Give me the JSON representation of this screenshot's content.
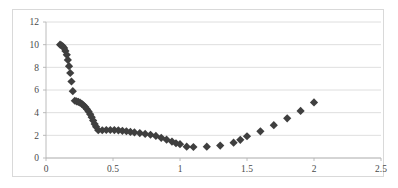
{
  "chart_data": {
    "type": "scatter",
    "title": "",
    "subtitle": "",
    "xlabel": "",
    "ylabel": "",
    "xlim": [
      0,
      2.5
    ],
    "ylim": [
      0,
      12
    ],
    "xticks": [
      0,
      0.5,
      1,
      1.5,
      2,
      2.5
    ],
    "xtick_labels": [
      "0",
      "0.5",
      "1",
      "1.5",
      "2",
      "2.5"
    ],
    "yticks": [
      0,
      2,
      4,
      6,
      8,
      10,
      12
    ],
    "ytick_labels": [
      "0",
      "2",
      "4",
      "6",
      "8",
      "10",
      "12"
    ],
    "grid": "horizontal",
    "legend": "none",
    "marker_style": "diamond",
    "marker_color": "#3f3f3f",
    "marker_size": 4.1,
    "background_color": "#ffffff",
    "gridline_color": "#d6d6d6",
    "axis_color": "#b4b4b4",
    "frame_color": "#d9d9d9",
    "series": [
      {
        "name": "series-1",
        "points": [
          [
            0.105,
            10.0
          ],
          [
            0.115,
            9.95
          ],
          [
            0.125,
            9.85
          ],
          [
            0.135,
            9.7
          ],
          [
            0.145,
            9.45
          ],
          [
            0.155,
            9.1
          ],
          [
            0.163,
            8.65
          ],
          [
            0.172,
            8.1
          ],
          [
            0.181,
            7.5
          ],
          [
            0.19,
            6.75
          ],
          [
            0.2,
            5.9
          ],
          [
            0.215,
            5.05
          ],
          [
            0.228,
            5.0
          ],
          [
            0.241,
            4.95
          ],
          [
            0.254,
            4.88
          ],
          [
            0.267,
            4.78
          ],
          [
            0.28,
            4.65
          ],
          [
            0.293,
            4.5
          ],
          [
            0.306,
            4.3
          ],
          [
            0.318,
            4.1
          ],
          [
            0.33,
            3.85
          ],
          [
            0.341,
            3.6
          ],
          [
            0.352,
            3.3
          ],
          [
            0.363,
            3.0
          ],
          [
            0.374,
            2.75
          ],
          [
            0.39,
            2.45
          ],
          [
            0.42,
            2.45
          ],
          [
            0.45,
            2.47
          ],
          [
            0.48,
            2.47
          ],
          [
            0.51,
            2.46
          ],
          [
            0.54,
            2.44
          ],
          [
            0.57,
            2.4
          ],
          [
            0.6,
            2.36
          ],
          [
            0.63,
            2.3
          ],
          [
            0.66,
            2.26
          ],
          [
            0.7,
            2.2
          ],
          [
            0.74,
            2.12
          ],
          [
            0.78,
            2.05
          ],
          [
            0.82,
            1.95
          ],
          [
            0.86,
            1.78
          ],
          [
            0.9,
            1.62
          ],
          [
            0.94,
            1.45
          ],
          [
            0.97,
            1.3
          ],
          [
            1.0,
            1.22
          ],
          [
            1.05,
            1.0
          ],
          [
            1.1,
            0.97
          ],
          [
            1.2,
            1.0
          ],
          [
            1.3,
            1.1
          ],
          [
            1.4,
            1.35
          ],
          [
            1.45,
            1.6
          ],
          [
            1.5,
            1.92
          ],
          [
            1.6,
            2.35
          ],
          [
            1.7,
            2.9
          ],
          [
            1.8,
            3.5
          ],
          [
            1.9,
            4.15
          ],
          [
            2.0,
            4.9
          ]
        ]
      }
    ]
  },
  "plot_geometry": {
    "left": 46,
    "right": 381,
    "top": 22,
    "bottom": 158
  }
}
